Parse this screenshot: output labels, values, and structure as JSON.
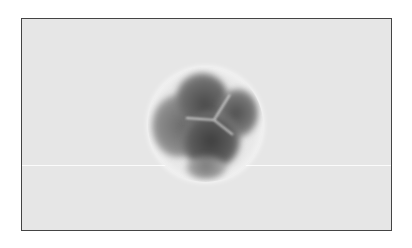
{
  "image": {
    "description": "Grayscale micrograph of a spherical cell cluster inside a bordered frame",
    "colors": {
      "frame_border": "#444444",
      "background": "#e6e6e6",
      "dark_lobes": "#4a4a4a",
      "halo": "#ffffff"
    }
  }
}
